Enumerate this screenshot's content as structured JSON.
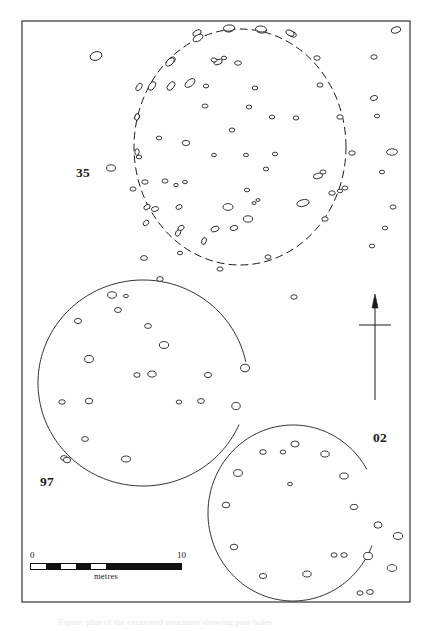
{
  "figure": {
    "kind": "archaeological-site-plan",
    "background_color": "#fefefe",
    "ink_color": "#1a1a1a",
    "frame": {
      "x": 22,
      "y": 21,
      "width": 388,
      "height": 581,
      "stroke": "#333333",
      "stroke_width": 1.2
    },
    "caption_text": "Figure: plan of the excavated structures showing post-holes"
  },
  "structure_labels": [
    {
      "id": "35",
      "text": "35",
      "x": 76,
      "y": 165,
      "structure": "dashed-circle-north"
    },
    {
      "id": "97",
      "text": "97",
      "x": 40,
      "y": 474,
      "structure": "solid-circle-west"
    },
    {
      "id": "02",
      "text": "02",
      "x": 373,
      "y": 430,
      "structure": "solid-circle-southeast"
    }
  ],
  "north_arrow": {
    "name": "north-arrow",
    "shaft_x": 375,
    "shaft_top": 308,
    "shaft_bottom": 400,
    "crossbar_y": 325,
    "crossbar_half_width": 16,
    "head_width": 6,
    "head_height": 14
  },
  "scale_bar": {
    "left_label": "0",
    "right_label": "10",
    "unit_label": "metres",
    "segments": 10,
    "filled_pattern": [
      "off",
      "on",
      "off",
      "on",
      "off",
      "on",
      "on",
      "on",
      "on",
      "on"
    ],
    "x": 30,
    "y": 550,
    "width": 152,
    "height": 7,
    "fill_color": "#111111",
    "empty_color": "#ffffff"
  },
  "chart_data": {
    "type": "scatter",
    "xlabel": "",
    "ylabel": "",
    "grid": false,
    "legend": "none",
    "units": "metres",
    "enclosures": [
      {
        "label": "35",
        "style": "dashed",
        "cx": 240,
        "cy": 147,
        "rx": 106,
        "ry": 118,
        "note": "northern ring, dashed outline, complete circuit"
      },
      {
        "label": "97",
        "style": "solid",
        "cx": 143,
        "cy": 383,
        "rx": 105,
        "ry": 103,
        "gap_from_deg": -12,
        "gap_to_deg": 24,
        "note": "western ring, solid outline with entrance gap on east side"
      },
      {
        "label": "02",
        "style": "solid",
        "cx": 293,
        "cy": 513,
        "rx": 85,
        "ry": 88,
        "gap_from_deg": -30,
        "gap_to_deg": 22,
        "note": "south-eastern ring, solid outline with entrance gap on east side"
      }
    ],
    "postholes_inside_35": [
      [
        197,
        33,
        4.5,
        2.6,
        -28
      ],
      [
        229,
        29,
        5.2,
        3.0,
        -5
      ],
      [
        261,
        30,
        5.4,
        3.0,
        8
      ],
      [
        292,
        34,
        4.6,
        2.6,
        22
      ],
      [
        171,
        61,
        5.0,
        3.0,
        -42
      ],
      [
        218,
        62,
        4.4,
        2.6,
        -18
      ],
      [
        238,
        63,
        3.4,
        2.2,
        0
      ],
      [
        171,
        86,
        5.0,
        2.9,
        -50
      ],
      [
        190,
        83,
        5.8,
        3.2,
        -38
      ],
      [
        214,
        60,
        3.0,
        2.0,
        10
      ],
      [
        224,
        58,
        2.6,
        1.8,
        0
      ],
      [
        139,
        87,
        4.2,
        2.4,
        -58
      ],
      [
        137,
        117,
        3.2,
        2.2,
        -70
      ],
      [
        206,
        86,
        2.7,
        1.9,
        0
      ],
      [
        255,
        88,
        2.8,
        1.9,
        0
      ],
      [
        205,
        106,
        3.0,
        2.0,
        0
      ],
      [
        249,
        107,
        2.8,
        1.9,
        0
      ],
      [
        272,
        117,
        2.8,
        1.9,
        0
      ],
      [
        296,
        118,
        2.9,
        2.0,
        0
      ],
      [
        232,
        130,
        2.9,
        2.0,
        0
      ],
      [
        159,
        138,
        2.8,
        1.9,
        0
      ],
      [
        186,
        143,
        3.8,
        2.6,
        0
      ],
      [
        214,
        155,
        2.4,
        1.7,
        0
      ],
      [
        246,
        155,
        2.5,
        1.7,
        0
      ],
      [
        275,
        154,
        2.6,
        1.8,
        0
      ],
      [
        266,
        169,
        2.7,
        1.9,
        0
      ],
      [
        318,
        176,
        4.6,
        2.7,
        -10
      ],
      [
        165,
        181,
        3.0,
        2.1,
        0
      ],
      [
        176,
        185,
        2.2,
        1.6,
        0
      ],
      [
        185,
        182,
        2.4,
        1.7,
        0
      ],
      [
        247,
        190,
        2.6,
        1.8,
        0
      ],
      [
        254,
        203,
        2.1,
        1.5,
        0
      ],
      [
        258,
        200,
        2.0,
        1.4,
        0
      ],
      [
        228,
        207,
        5.0,
        3.4,
        0
      ],
      [
        248,
        219,
        4.6,
        3.2,
        0
      ],
      [
        303,
        203,
        6.2,
        3.3,
        -14
      ],
      [
        215,
        229,
        4.2,
        2.6,
        -20
      ],
      [
        234,
        228,
        3.8,
        2.5,
        -12
      ],
      [
        179,
        207,
        3.2,
        2.2,
        -22
      ],
      [
        181,
        228,
        3.4,
        2.3,
        -30
      ],
      [
        204,
        241,
        3.6,
        2.2,
        -70
      ],
      [
        155,
        209,
        3.6,
        2.4,
        -10
      ],
      [
        323,
        172,
        3.0,
        2.0,
        0
      ],
      [
        332,
        193,
        3.2,
        2.2,
        0
      ]
    ],
    "postholes_on_35_ring": [
      [
        198,
        38,
        5.4,
        3.0,
        -30
      ],
      [
        229,
        28,
        5.6,
        3.1,
        -4
      ],
      [
        261,
        29,
        5.4,
        3.0,
        6
      ],
      [
        170,
        62,
        5.2,
        2.9,
        -44
      ],
      [
        152,
        86,
        4.8,
        2.8,
        -56
      ],
      [
        137,
        117,
        3.4,
        2.2,
        -72
      ],
      [
        137,
        152,
        3.2,
        2.2,
        -86
      ],
      [
        139,
        157,
        2.8,
        1.9,
        0
      ],
      [
        133,
        189,
        3.0,
        2.1,
        0
      ],
      [
        145,
        182,
        3.2,
        2.2,
        0
      ],
      [
        147,
        207,
        3.4,
        2.3,
        -34
      ],
      [
        146,
        223,
        3.2,
        2.2,
        -42
      ],
      [
        178,
        233,
        3.4,
        2.3,
        -60
      ],
      [
        180,
        253,
        2.6,
        1.8,
        0
      ],
      [
        220,
        269,
        3.0,
        2.1,
        0
      ],
      [
        268,
        257,
        3.0,
        2.1,
        0
      ],
      [
        325,
        219,
        3.2,
        2.2,
        0
      ],
      [
        345,
        188,
        3.0,
        2.0,
        0
      ],
      [
        352,
        153,
        3.2,
        2.2,
        0
      ],
      [
        340,
        117,
        3.2,
        2.2,
        0
      ],
      [
        320,
        85,
        3.0,
        2.1,
        0
      ],
      [
        290,
        33,
        4.4,
        2.6,
        24
      ],
      [
        317,
        58,
        3.2,
        2.2,
        0
      ],
      [
        340,
        191,
        2.6,
        1.8,
        0
      ]
    ],
    "postholes_inside_97": [
      [
        112,
        295,
        4.4,
        3.2,
        0
      ],
      [
        126,
        296,
        2.4,
        1.7,
        0
      ],
      [
        118,
        310,
        3.4,
        2.5,
        0
      ],
      [
        78,
        321,
        3.6,
        2.6,
        0
      ],
      [
        148,
        326,
        3.4,
        2.4,
        0
      ],
      [
        164,
        345,
        4.6,
        3.4,
        0
      ],
      [
        89,
        359,
        4.4,
        3.6,
        0
      ],
      [
        137,
        375,
        3.2,
        2.3,
        0
      ],
      [
        152,
        374,
        4.2,
        3.0,
        0
      ],
      [
        208,
        375,
        3.6,
        2.6,
        0
      ],
      [
        62,
        402,
        3.2,
        2.3,
        0
      ],
      [
        89,
        401,
        3.8,
        2.8,
        0
      ],
      [
        179,
        402,
        2.8,
        2.0,
        0
      ],
      [
        201,
        401,
        3.4,
        2.4,
        0
      ],
      [
        85,
        439,
        3.4,
        2.4,
        0
      ],
      [
        126,
        459,
        4.4,
        3.0,
        0
      ],
      [
        64,
        458,
        3.4,
        2.4,
        0
      ]
    ],
    "postholes_inside_02": [
      [
        263,
        452,
        3.2,
        2.4,
        0
      ],
      [
        283,
        452,
        2.8,
        2.0,
        0
      ],
      [
        295,
        444,
        4.0,
        3.0,
        0
      ],
      [
        325,
        454,
        4.2,
        3.0,
        0
      ],
      [
        238,
        473,
        4.4,
        3.4,
        0
      ],
      [
        344,
        476,
        4.2,
        3.0,
        0
      ],
      [
        290,
        484,
        2.4,
        1.7,
        0
      ],
      [
        226,
        505,
        3.8,
        2.8,
        0
      ],
      [
        354,
        507,
        3.8,
        2.6,
        -8
      ],
      [
        234,
        547,
        3.8,
        2.8,
        0
      ],
      [
        263,
        576,
        3.6,
        2.6,
        0
      ],
      [
        307,
        574,
        4.2,
        3.0,
        0
      ],
      [
        334,
        555,
        3.0,
        2.2,
        0
      ],
      [
        344,
        555,
        3.2,
        2.3,
        0
      ]
    ],
    "postholes_outside": [
      [
        396,
        30,
        4.8,
        3.0,
        -14
      ],
      [
        374,
        57,
        3.2,
        2.2,
        0
      ],
      [
        374,
        98,
        3.6,
        2.4,
        -14
      ],
      [
        377,
        116,
        2.6,
        1.8,
        0
      ],
      [
        392,
        152,
        5.4,
        3.2,
        -4
      ],
      [
        382,
        172,
        2.6,
        1.8,
        0
      ],
      [
        393,
        207,
        3.0,
        2.1,
        0
      ],
      [
        385,
        228,
        2.8,
        1.9,
        0
      ],
      [
        372,
        246,
        2.8,
        1.9,
        0
      ],
      [
        96,
        56,
        6.0,
        4.2,
        -18
      ],
      [
        111,
        168,
        4.4,
        3.2,
        0
      ],
      [
        294,
        297,
        3.2,
        2.2,
        0
      ],
      [
        144,
        258,
        3.4,
        2.4,
        0
      ],
      [
        398,
        536,
        4.6,
        3.4,
        0
      ],
      [
        392,
        568,
        4.8,
        3.4,
        0
      ],
      [
        360,
        593,
        3.0,
        2.2,
        0
      ],
      [
        370,
        592,
        3.4,
        2.4,
        0
      ]
    ],
    "terminal_postholes": [
      [
        245,
        368,
        4.4,
        3.8,
        0
      ],
      [
        236,
        406,
        4.2,
        3.6,
        0
      ],
      [
        67,
        460,
        3.6,
        2.8,
        0
      ],
      [
        160,
        279,
        3.2,
        2.4,
        0
      ],
      [
        378,
        525,
        4.0,
        3.2,
        0
      ],
      [
        368,
        556,
        4.4,
        3.6,
        0
      ]
    ]
  }
}
